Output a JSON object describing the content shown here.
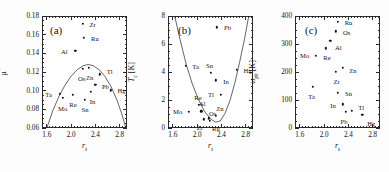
{
  "figure": {
    "panels": [
      "a",
      "b",
      "c"
    ],
    "shared_xlabel": "r_s",
    "x_ticks": [
      "1.6",
      "2.0",
      "2.4",
      "2.8"
    ],
    "xlim": [
      1.52,
      2.92
    ]
  },
  "chart_data": [
    {
      "type": "scatter",
      "panel": "(a)",
      "title": "",
      "xlabel": "r_s",
      "ylabel": "μ*",
      "xlim": [
        1.52,
        2.92
      ],
      "ylim": [
        0.06,
        0.18
      ],
      "x_ticks": [
        "1.6",
        "2.0",
        "2.4",
        "2.8"
      ],
      "x_tick_values": [
        1.6,
        2.0,
        2.4,
        2.8
      ],
      "y_ticks": [
        "0.06",
        "0.08",
        "0.10",
        "0.12",
        "0.14",
        "0.16",
        "0.18"
      ],
      "y_tick_values": [
        0.06,
        0.08,
        0.1,
        0.12,
        0.14,
        0.16,
        0.18
      ],
      "grid": false,
      "legend": "none",
      "points": [
        {
          "label": "Ta",
          "x": 1.81,
          "y": 0.0965,
          "lx": -11,
          "ly": 0
        },
        {
          "label": "Mo",
          "x": 1.86,
          "y": 0.0925,
          "lx": 0,
          "ly": 10
        },
        {
          "label": "Re",
          "x": 2.03,
          "y": 0.0955,
          "lx": 0,
          "ly": 9
        },
        {
          "label": "Os",
          "x": 2.19,
          "y": 0.1235,
          "lx": -1,
          "ly": 9
        },
        {
          "label": "Zn",
          "x": 2.29,
          "y": 0.1245,
          "lx": 1,
          "ly": 9
        },
        {
          "label": "Al",
          "x": 2.07,
          "y": 0.1425,
          "lx": -11,
          "ly": 0
        },
        {
          "label": "Zr",
          "x": 2.19,
          "y": 0.1715,
          "lx": 10,
          "ly": 0
        },
        {
          "label": "Ru",
          "x": 2.21,
          "y": 0.1565,
          "lx": 11,
          "ly": 0
        },
        {
          "label": "Sn",
          "x": 2.23,
          "y": 0.0905,
          "lx": 0,
          "ly": 9
        },
        {
          "label": "In",
          "x": 2.32,
          "y": 0.0985,
          "lx": 2,
          "ly": 9
        },
        {
          "label": "Pb",
          "x": 2.4,
          "y": 0.1065,
          "lx": 10,
          "ly": 1
        },
        {
          "label": "Tl",
          "x": 2.47,
          "y": 0.1175,
          "lx": 10,
          "ly": -3
        },
        {
          "label": "Hg",
          "x": 2.65,
          "y": 0.1005,
          "lx": 11,
          "ly": 0
        }
      ],
      "curve": {
        "description": "inverted-parabola trend line",
        "points": [
          {
            "x": 1.6,
            "y": 0.06
          },
          {
            "x": 1.7,
            "y": 0.079
          },
          {
            "x": 1.8,
            "y": 0.094
          },
          {
            "x": 1.9,
            "y": 0.106
          },
          {
            "x": 2.0,
            "y": 0.1155
          },
          {
            "x": 2.1,
            "y": 0.1225
          },
          {
            "x": 2.2,
            "y": 0.1268
          },
          {
            "x": 2.28,
            "y": 0.128
          },
          {
            "x": 2.36,
            "y": 0.1268
          },
          {
            "x": 2.46,
            "y": 0.1225
          },
          {
            "x": 2.56,
            "y": 0.115
          },
          {
            "x": 2.66,
            "y": 0.104
          },
          {
            "x": 2.76,
            "y": 0.089
          },
          {
            "x": 2.84,
            "y": 0.074
          },
          {
            "x": 2.9,
            "y": 0.06
          }
        ]
      }
    },
    {
      "type": "scatter",
      "panel": "(b)",
      "title": "",
      "xlabel": "r_s",
      "ylabel": "T_c [K]",
      "xlim": [
        1.52,
        2.92
      ],
      "ylim": [
        0,
        8
      ],
      "x_ticks": [
        "1.6",
        "2.0",
        "2.4",
        "2.8"
      ],
      "x_tick_values": [
        1.6,
        2.0,
        2.4,
        2.8
      ],
      "y_ticks": [
        "0",
        "2",
        "4",
        "6",
        "8"
      ],
      "y_tick_values": [
        0,
        2,
        4,
        6,
        8
      ],
      "grid": false,
      "legend": "none",
      "points": [
        {
          "label": "Mo",
          "x": 1.86,
          "y": 1.15,
          "lx": -11,
          "ly": -1
        },
        {
          "label": "Ta",
          "x": 1.81,
          "y": 4.45,
          "lx": 10,
          "ly": 0
        },
        {
          "label": "Re",
          "x": 2.03,
          "y": 1.65,
          "lx": -1,
          "ly": -8
        },
        {
          "label": "Al",
          "x": 2.07,
          "y": 1.18,
          "lx": 1,
          "ly": -8
        },
        {
          "label": "Zr",
          "x": 2.11,
          "y": 0.62,
          "lx": -4,
          "ly": 8
        },
        {
          "label": "Os",
          "x": 2.19,
          "y": 0.68,
          "lx": 4,
          "ly": -5
        },
        {
          "label": "Ru",
          "x": 2.21,
          "y": 0.5,
          "lx": 6,
          "ly": 7
        },
        {
          "label": "Zn",
          "x": 2.31,
          "y": 0.88,
          "lx": 4,
          "ly": -8
        },
        {
          "label": "Sn",
          "x": 2.22,
          "y": 3.95,
          "lx": -1,
          "ly": -8
        },
        {
          "label": "In",
          "x": 2.31,
          "y": 3.4,
          "lx": 10,
          "ly": 1
        },
        {
          "label": "Tl",
          "x": 2.39,
          "y": 2.35,
          "lx": -10,
          "ly": -1
        },
        {
          "label": "Pb",
          "x": 2.32,
          "y": 7.2,
          "lx": 11,
          "ly": 0
        },
        {
          "label": "Hg",
          "x": 2.65,
          "y": 4.15,
          "lx": 11,
          "ly": 0
        }
      ],
      "curve": {
        "description": "upward parabola-like boundary",
        "points": [
          {
            "x": 1.63,
            "y": 8.0
          },
          {
            "x": 1.72,
            "y": 6.3
          },
          {
            "x": 1.82,
            "y": 4.55
          },
          {
            "x": 1.92,
            "y": 3.15
          },
          {
            "x": 2.02,
            "y": 2.05
          },
          {
            "x": 2.12,
            "y": 1.2
          },
          {
            "x": 2.22,
            "y": 0.65
          },
          {
            "x": 2.3,
            "y": 0.42
          },
          {
            "x": 2.38,
            "y": 0.5
          },
          {
            "x": 2.46,
            "y": 1.05
          },
          {
            "x": 2.54,
            "y": 1.95
          },
          {
            "x": 2.62,
            "y": 3.2
          },
          {
            "x": 2.7,
            "y": 4.7
          },
          {
            "x": 2.78,
            "y": 6.35
          },
          {
            "x": 2.85,
            "y": 8.0
          }
        ]
      }
    },
    {
      "type": "scatter",
      "panel": "(c)",
      "title": "",
      "xlabel": "r_s",
      "ylabel": "ω_ph [K]",
      "xlim": [
        1.52,
        2.92
      ],
      "ylim": [
        0,
        400
      ],
      "x_ticks": [
        "1.6",
        "2.0",
        "2.4",
        "2.8"
      ],
      "x_tick_values": [
        1.6,
        2.0,
        2.4,
        2.8
      ],
      "y_ticks": [
        "0",
        "100",
        "200",
        "300",
        "400"
      ],
      "y_tick_values": [
        0,
        100,
        200,
        300,
        400
      ],
      "grid": false,
      "legend": "none",
      "points": [
        {
          "label": "Ta",
          "x": 1.81,
          "y": 148,
          "lx": -1,
          "ly": 9
        },
        {
          "label": "Mo",
          "x": 1.86,
          "y": 258,
          "lx": -11,
          "ly": -1
        },
        {
          "label": "Re",
          "x": 2.03,
          "y": 285,
          "lx": 1,
          "ly": 9
        },
        {
          "label": "Al",
          "x": 2.1,
          "y": 312,
          "lx": 8,
          "ly": 6
        },
        {
          "label": "Os",
          "x": 2.19,
          "y": 345,
          "lx": 11,
          "ly": 1
        },
        {
          "label": "Ru",
          "x": 2.22,
          "y": 380,
          "lx": 11,
          "ly": 0
        },
        {
          "label": "Zr",
          "x": 2.19,
          "y": 200,
          "lx": 1,
          "ly": 9
        },
        {
          "label": "Zn",
          "x": 2.31,
          "y": 215,
          "lx": 10,
          "ly": 2
        },
        {
          "label": "Sn",
          "x": 2.22,
          "y": 125,
          "lx": 11,
          "ly": 0
        },
        {
          "label": "In",
          "x": 2.31,
          "y": 85,
          "lx": -10,
          "ly": 1
        },
        {
          "label": "Pb",
          "x": 2.36,
          "y": 58,
          "lx": -2,
          "ly": 9
        },
        {
          "label": "Tl",
          "x": 2.46,
          "y": 62,
          "lx": 9,
          "ly": -4
        },
        {
          "label": "Hg",
          "x": 2.63,
          "y": 48,
          "lx": 9,
          "ly": 8
        }
      ]
    }
  ]
}
